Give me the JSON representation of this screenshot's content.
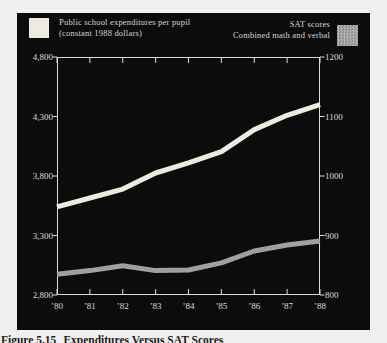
{
  "colors": {
    "page_background": "#f1f0ee",
    "panel_background": "#0c0c0c",
    "axis_and_text": "#dedbd3",
    "expenditures_line": "#edeadf",
    "sat_line_dark": "#8d8d8d",
    "sat_line_light": "#b3b3b3"
  },
  "legend": {
    "left": {
      "line1": "Public school expenditures per pupil",
      "line2": "(constant 1988 dollars)",
      "swatch_color": "#edeadf"
    },
    "right": {
      "line1": "SAT scores",
      "line2": "Combined math and verbal",
      "swatch_color": "#a0a0a0"
    }
  },
  "caption": {
    "figure_label": "Figure 5.15",
    "title": "Expenditures Versus SAT Scores"
  },
  "chart_data": {
    "type": "line",
    "title": "",
    "x": [
      "’80",
      "’81",
      "’82",
      "’83",
      "’84",
      "’85",
      "’86",
      "’87",
      "’88"
    ],
    "series": [
      {
        "name": "Public school expenditures per pupil (constant 1988 dollars)",
        "axis": "left",
        "color": "#edeadf",
        "values": [
          3540,
          3615,
          3690,
          3825,
          3910,
          4005,
          4190,
          4310,
          4400
        ]
      },
      {
        "name": "SAT scores (combined math and verbal)",
        "axis": "right",
        "color": "halftone-gray",
        "values": [
          835,
          841,
          849,
          841,
          842,
          854,
          874,
          884,
          891
        ]
      }
    ],
    "left_axis": {
      "min": 2800,
      "max": 4800,
      "tick_labels": [
        "4,800",
        "4,300",
        "3,800",
        "3,300",
        "2,800"
      ]
    },
    "right_axis": {
      "min": 800,
      "max": 1200,
      "tick_labels": [
        "1200",
        "1100",
        "1000",
        "900",
        "800"
      ]
    },
    "grid": false,
    "legend_position": "top",
    "plot_background": "#0c0c0c",
    "values_note": "approximate, read from pixels"
  }
}
